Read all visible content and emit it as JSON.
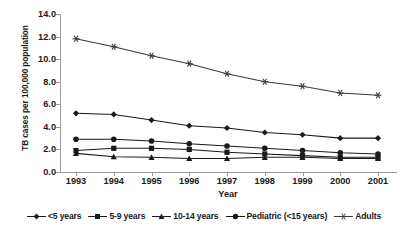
{
  "chart_data": {
    "type": "line",
    "title": "",
    "xlabel": "Year",
    "ylabel": "TB cases per 100,000 population",
    "categories": [
      "1993",
      "1994",
      "1995",
      "1996",
      "1997",
      "1998",
      "1999",
      "2000",
      "2001"
    ],
    "ylim": [
      0.0,
      14.0
    ],
    "ytick_labels": [
      "0.0",
      "2.0",
      "4.0",
      "6.0",
      "8.0",
      "10.0",
      "12.0",
      "14.0"
    ],
    "ytick_values": [
      0.0,
      2.0,
      4.0,
      6.0,
      8.0,
      10.0,
      12.0,
      14.0
    ],
    "grid": false,
    "legend_position": "bottom",
    "series": [
      {
        "name": "<5 years",
        "marker": "diamond",
        "color": "#1a1a1a",
        "values": [
          5.2,
          5.1,
          4.6,
          4.1,
          3.9,
          3.5,
          3.3,
          3.0,
          3.0
        ]
      },
      {
        "name": "5-9 years",
        "marker": "square",
        "color": "#1a1a1a",
        "values": [
          1.9,
          2.1,
          2.1,
          2.0,
          1.75,
          1.6,
          1.45,
          1.3,
          1.3
        ]
      },
      {
        "name": "10-14 years",
        "marker": "triangle",
        "color": "#1a1a1a",
        "values": [
          1.65,
          1.35,
          1.3,
          1.2,
          1.2,
          1.3,
          1.3,
          1.2,
          1.2
        ]
      },
      {
        "name": "Pediatric (<15 years)",
        "marker": "circle",
        "color": "#1a1a1a",
        "values": [
          2.9,
          2.9,
          2.75,
          2.5,
          2.3,
          2.1,
          1.9,
          1.7,
          1.6
        ]
      },
      {
        "name": "Adults",
        "marker": "asterisk",
        "color": "#3a3a3a",
        "values": [
          11.8,
          11.1,
          10.3,
          9.6,
          8.7,
          8.0,
          7.6,
          7.0,
          6.8
        ]
      }
    ]
  }
}
